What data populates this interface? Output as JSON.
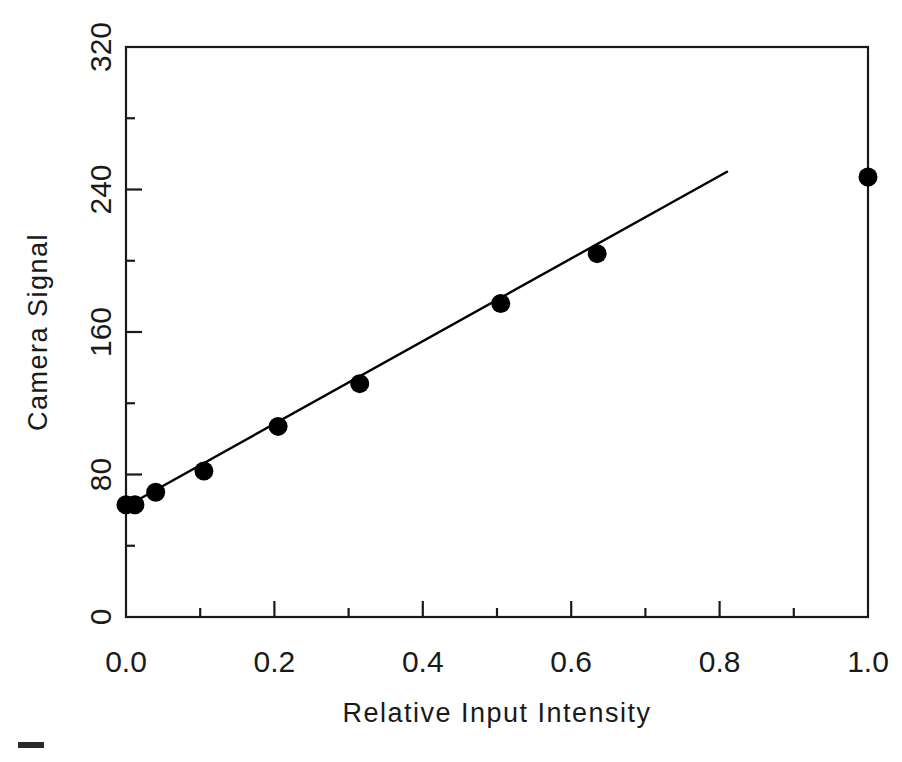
{
  "figure": {
    "background_color": "#ffffff",
    "ink_color": "#1a1a1a",
    "marker_color": "#000000"
  },
  "chart_data": {
    "type": "scatter",
    "title": "",
    "subtitle": "",
    "xlabel": "Relative Input Intensity",
    "ylabel": "Camera Signal",
    "xlim": [
      0.0,
      1.0
    ],
    "ylim": [
      0,
      320
    ],
    "xticks": [
      0.0,
      0.2,
      0.4,
      0.6,
      0.8,
      1.0
    ],
    "xtick_labels": [
      "0.0",
      "0.2",
      "0.4",
      "0.6",
      "0.8",
      "1.0"
    ],
    "yticks": [
      0,
      80,
      160,
      240,
      320
    ],
    "ytick_labels": [
      "0",
      "80",
      "160",
      "240",
      "320"
    ],
    "x_minor_tick_interval": 0.1,
    "y_minor_tick_interval": 40,
    "grid": false,
    "legend": false,
    "legend_position": "none",
    "series": [
      {
        "name": "Measured camera signal",
        "marker": "filled-circle",
        "x": [
          0.0,
          0.012,
          0.04,
          0.105,
          0.205,
          0.315,
          0.505,
          0.635,
          1.0
        ],
        "y": [
          63,
          63,
          70,
          82,
          107,
          131,
          176,
          204,
          247
        ]
      },
      {
        "name": "Linear fit",
        "marker": "line",
        "x": [
          0.0,
          0.81
        ],
        "y": [
          62,
          250
        ]
      }
    ],
    "annotations": []
  },
  "axes": {
    "x_title": "Relative Input Intensity",
    "y_title": "Camera Signal"
  }
}
